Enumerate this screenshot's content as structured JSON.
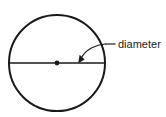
{
  "figure": {
    "kind": "geometry-diagram",
    "background_color": "#ffffff",
    "stroke_color": "#1a1a1a"
  },
  "labels": {
    "diameter": "diameter"
  },
  "geometry": {
    "circle": {
      "center_x": 57,
      "center_y": 63,
      "radius": 48,
      "stroke_width": 2,
      "fill": "none"
    },
    "center_point": {
      "x": 57,
      "y": 63,
      "radius": 2.4,
      "fill": "#1a1a1a"
    },
    "diameter_line": {
      "x1": 9,
      "y1": 63,
      "x2": 105,
      "y2": 63,
      "stroke_width": 1.4
    },
    "leader_line": {
      "x1": 105,
      "y1": 44,
      "x2": 115,
      "y2": 44,
      "stroke_width": 1.2
    },
    "leader_arrow": {
      "path": "M 105 44 C 98 44 86 49 80.5 59.5",
      "stroke_width": 1.2,
      "arrowhead_points": "78.5,63 79.4,55.6 84.2,60.0"
    },
    "label_position": {
      "x": 118,
      "y": 48
    }
  }
}
